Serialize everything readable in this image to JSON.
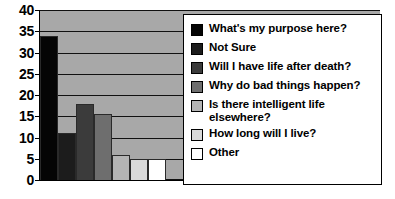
{
  "chart_data": {
    "type": "bar",
    "title": "",
    "subtitle": "",
    "xlabel": "",
    "ylabel": "",
    "ylim": [
      0,
      40
    ],
    "ytick_step": 5,
    "yticks": [
      "40",
      "35",
      "30",
      "25",
      "20",
      "15",
      "10",
      "5",
      "0"
    ],
    "grid": true,
    "legend_position": "right-overlay",
    "categories": [
      "What's my purpose here?",
      "Not Sure",
      "Will I have life after death?",
      "Why do bad things happen?",
      "Is there intelligent life elsewhere?",
      "How long will I live?",
      "Other"
    ],
    "values": [
      34,
      11,
      18,
      15.5,
      6,
      5,
      5
    ],
    "colors": [
      "#050505",
      "#1c1c1c",
      "#3b3b3b",
      "#6e6e6e",
      "#b4b4b4",
      "#d9d9d9",
      "#ffffff"
    ],
    "plot_background": "#a8a8a8"
  },
  "legend": {
    "items": [
      {
        "label": "What's my purpose here?",
        "color": "#050505"
      },
      {
        "label": "Not Sure",
        "color": "#1c1c1c"
      },
      {
        "label": "Will I have life after death?",
        "color": "#3b3b3b"
      },
      {
        "label": "Why do bad things happen?",
        "color": "#6e6e6e"
      },
      {
        "label": "Is there intelligent life\nelsewhere?",
        "color": "#b4b4b4"
      },
      {
        "label": "How long will I live?",
        "color": "#d9d9d9"
      },
      {
        "label": "Other",
        "color": "#ffffff"
      }
    ]
  }
}
